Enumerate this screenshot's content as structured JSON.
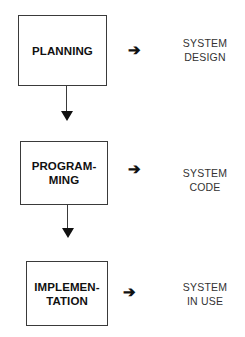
{
  "stages": [
    {
      "label": "PLANNING",
      "output": "SYSTEM\nDESIGN"
    },
    {
      "label": "PROGRAM-\nMING",
      "output": "SYSTEM\nCODE"
    },
    {
      "label": "IMPLEMEN-\nTATION",
      "output": "SYSTEM\nIN  USE"
    }
  ],
  "arrows": {
    "right": "➔",
    "down": "down-arrow"
  },
  "colors": {
    "line": "#3a3a3a",
    "text": "#111111",
    "background": "#ffffff"
  }
}
